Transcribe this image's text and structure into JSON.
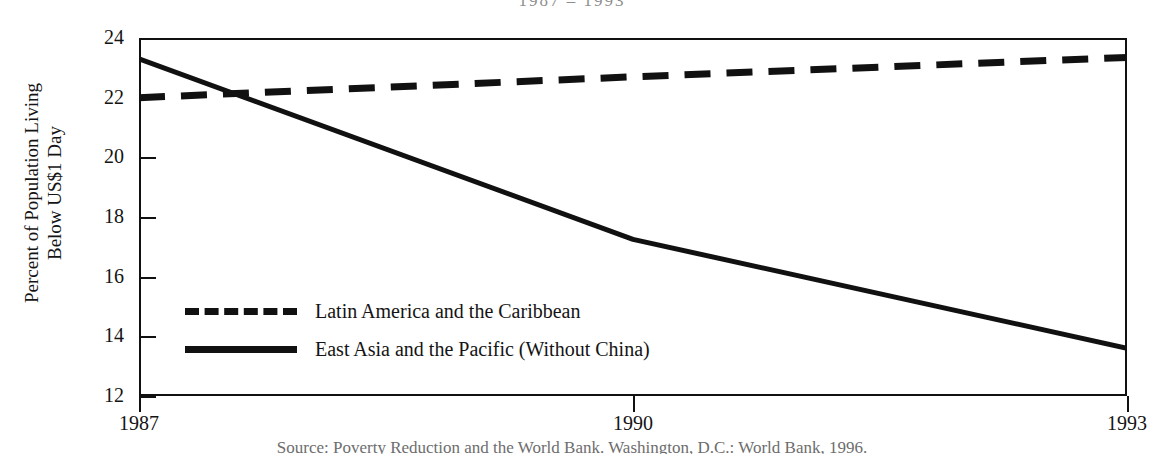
{
  "title_clipped": "1987 – 1993",
  "caption_clipped": "Source: Poverty Reduction and the World Bank. Washington, D.C.: World Bank, 1996.",
  "chart_data": {
    "type": "line",
    "title": "1987 – 1993",
    "xlabel": "",
    "ylabel": "Percent of Population Living Below US$1 Day",
    "ylabel_line1": "Percent of Population Living",
    "ylabel_line2": "Below US$1 Day",
    "xlim": [
      1987,
      1993
    ],
    "ylim": [
      12,
      24
    ],
    "ytick_labels": [
      "24",
      "22",
      "20",
      "18",
      "16",
      "14",
      "12"
    ],
    "yticks": [
      24,
      22,
      20,
      18,
      16,
      14,
      12
    ],
    "xtick_labels": [
      "1987",
      "1990",
      "1993"
    ],
    "xticks": [
      1987,
      1990,
      1993
    ],
    "grid": false,
    "legend_position": "inside-lower-left",
    "series": [
      {
        "name": "Latin America and the Caribbean",
        "style": "dashed",
        "color": "#111111",
        "x": [
          1987,
          1990,
          1993
        ],
        "values": [
          22.0,
          22.7,
          23.35
        ]
      },
      {
        "name": "East Asia and the Pacific (Without China)",
        "style": "solid",
        "color": "#111111",
        "x": [
          1987,
          1990,
          1993
        ],
        "values": [
          23.3,
          17.25,
          13.6
        ]
      }
    ]
  },
  "legend": {
    "items": [
      {
        "label": "Latin America and the Caribbean",
        "style": "dashed"
      },
      {
        "label": "East Asia and the Pacific (Without China)",
        "style": "solid"
      }
    ]
  }
}
